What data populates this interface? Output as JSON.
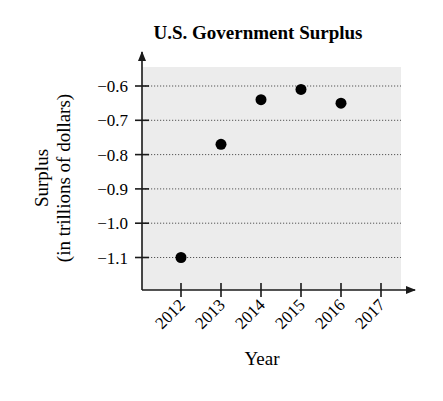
{
  "chart_data": {
    "type": "scatter",
    "title": "U.S. Government Surplus",
    "xlabel": "Year",
    "ylabel": "Surplus",
    "ylabel_sub": "(in trillions of dollars)",
    "x_ticks": [
      "2012",
      "2013",
      "2014",
      "2015",
      "2016",
      "2017"
    ],
    "y_ticks": [
      "−0.6",
      "−0.7",
      "−0.8",
      "−0.9",
      "−1.0",
      "−1.1"
    ],
    "y_tick_values": [
      -0.6,
      -0.7,
      -0.8,
      -0.9,
      -1.0,
      -1.1
    ],
    "ylim": [
      -1.2,
      -0.55
    ],
    "grid": "horizontal dotted",
    "legend": null,
    "points": [
      {
        "x": 2012,
        "y": -1.1
      },
      {
        "x": 2013,
        "y": -0.77
      },
      {
        "x": 2014,
        "y": -0.64
      },
      {
        "x": 2015,
        "y": -0.61
      },
      {
        "x": 2016,
        "y": -0.65
      }
    ],
    "x": [
      2012,
      2013,
      2014,
      2015,
      2016
    ],
    "values": [
      -1.1,
      -0.77,
      -0.64,
      -0.61,
      -0.65
    ]
  },
  "colors": {
    "plot_background": "#ececec",
    "axis": "#1a1a1a",
    "grid": "#555555",
    "point": "#000000"
  }
}
